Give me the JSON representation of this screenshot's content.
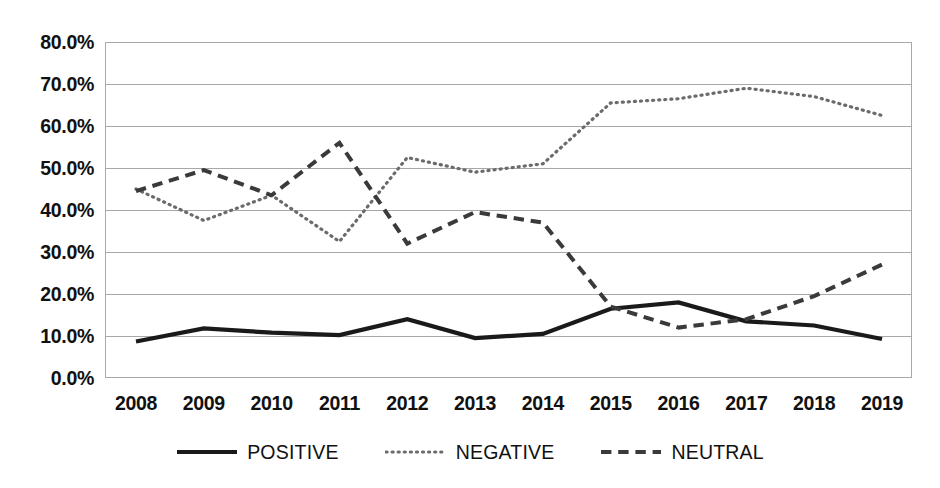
{
  "chart_data": {
    "type": "line",
    "title": "",
    "subtitle": "",
    "xlabel": "",
    "ylabel": "",
    "categories": [
      "2008",
      "2009",
      "2010",
      "2011",
      "2012",
      "2013",
      "2014",
      "2015",
      "2016",
      "2017",
      "2018",
      "2019"
    ],
    "ylim": [
      0,
      80
    ],
    "ytick_values": [
      0,
      10,
      20,
      30,
      40,
      50,
      60,
      70,
      80
    ],
    "ytick_labels": [
      "0.0%",
      "10.0%",
      "20.0%",
      "30.0%",
      "40.0%",
      "50.0%",
      "60.0%",
      "70.0%",
      "80.0%"
    ],
    "grid": true,
    "legend_position": "bottom",
    "series": [
      {
        "name": "POSITIVE",
        "style": "solid",
        "color": "#1a1a1a",
        "width": 4.2,
        "values": [
          8.7,
          11.8,
          10.8,
          10.2,
          14.0,
          9.5,
          10.5,
          16.5,
          18.0,
          13.5,
          12.5,
          9.3
        ]
      },
      {
        "name": "NEGATIVE",
        "style": "dotted",
        "color": "#6b6b6b",
        "width": 3.2,
        "values": [
          45.0,
          37.5,
          43.5,
          32.5,
          52.5,
          49.0,
          51.0,
          65.5,
          66.5,
          69.0,
          67.0,
          62.5
        ]
      },
      {
        "name": "NEUTRAL",
        "style": "dashed",
        "color": "#3a3a3a",
        "width": 4.0,
        "values": [
          44.5,
          49.5,
          43.5,
          56.0,
          32.0,
          39.5,
          37.0,
          17.0,
          12.0,
          14.0,
          19.5,
          27.0
        ]
      }
    ]
  },
  "legend": {
    "items": [
      {
        "label": "POSITIVE",
        "style": "solid"
      },
      {
        "label": "NEGATIVE",
        "style": "dotted"
      },
      {
        "label": "NEUTRAL",
        "style": "dashed"
      }
    ]
  },
  "colors": {
    "background": "#ffffff",
    "gridline": "#a8a8a8",
    "axis_text": "#111111",
    "positive": "#1a1a1a",
    "negative": "#6b6b6b",
    "neutral": "#3a3a3a"
  }
}
